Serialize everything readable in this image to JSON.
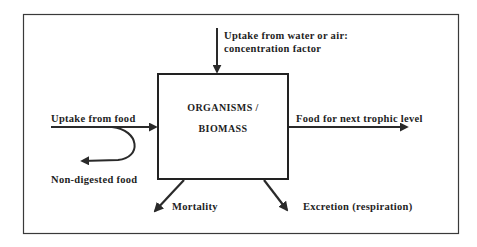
{
  "diagram": {
    "central_node": {
      "line1": "ORGANISMS /",
      "line2": "BIOMASS"
    },
    "flows": {
      "uptake_water_air_line1": "Uptake from water or air:",
      "uptake_water_air_line2": "concentration factor",
      "uptake_food": "Uptake from food",
      "non_digested": "Non-digested food",
      "next_trophic": "Food for next trophic level",
      "mortality": "Mortality",
      "excretion": "Excretion (respiration)"
    },
    "colors": {
      "stroke": "#2a2a2a",
      "background": "#ffffff",
      "text": "#1e1e1e"
    }
  }
}
